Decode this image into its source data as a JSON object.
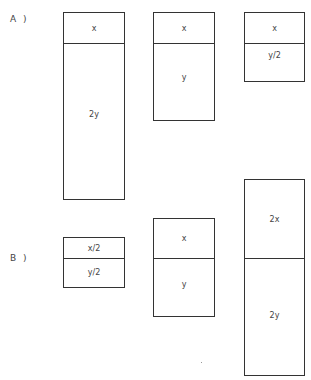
{
  "rows": [
    {
      "label": "A )",
      "boxes": [
        {
          "top_label": "x",
          "bottom_label": "2y"
        },
        {
          "top_label": "x",
          "bottom_label": "y"
        },
        {
          "top_label": "x",
          "bottom_label": "y/2"
        }
      ]
    },
    {
      "label": "B )",
      "boxes": [
        {
          "top_label": "x/2",
          "bottom_label": "y/2"
        },
        {
          "top_label": "x",
          "bottom_label": "y"
        },
        {
          "top_label": "2x",
          "bottom_label": "2y"
        }
      ]
    }
  ]
}
